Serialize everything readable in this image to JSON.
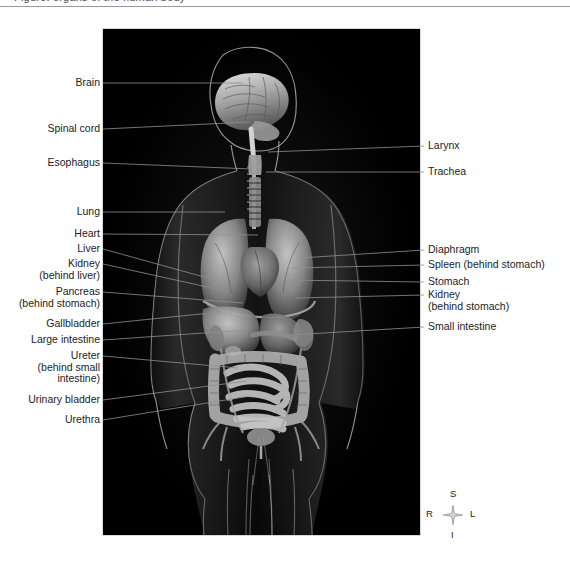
{
  "header": {
    "cropped_text": "Figure: organs of the human body"
  },
  "figure": {
    "caption_alt": "Frontal view of a human body with internal organs visible on a black background",
    "panel_bg": "#000000"
  },
  "labels_left": [
    {
      "id": "brain",
      "text": "Brain",
      "x": 68,
      "y": 77,
      "w": 32,
      "tip_x": 242,
      "tip_y": 83
    },
    {
      "id": "spinal-cord",
      "text": "Spinal cord",
      "x": 44,
      "y": 123,
      "w": 56,
      "tip_x": 250,
      "tip_y": 122
    },
    {
      "id": "esophagus",
      "text": "Esophagus",
      "x": 46,
      "y": 157,
      "w": 54,
      "tip_x": 252,
      "tip_y": 169
    },
    {
      "id": "lung",
      "text": "Lung",
      "x": 72,
      "y": 206,
      "w": 28,
      "tip_x": 225,
      "tip_y": 212
    },
    {
      "id": "heart",
      "text": "Heart",
      "x": 70,
      "y": 228,
      "w": 30,
      "tip_x": 258,
      "tip_y": 235
    },
    {
      "id": "liver",
      "text": "Liver",
      "x": 73,
      "y": 243,
      "w": 27,
      "tip_x": 215,
      "tip_y": 280
    },
    {
      "id": "kidney-left",
      "text": "Kidney\n(behind liver)",
      "x": 28,
      "y": 258,
      "w": 72,
      "tip_x": 230,
      "tip_y": 292
    },
    {
      "id": "pancreas",
      "text": "Pancreas\n(behind stomach)",
      "x": 8,
      "y": 286,
      "w": 92,
      "tip_x": 243,
      "tip_y": 303
    },
    {
      "id": "gallbladder",
      "text": "Gallbladder",
      "x": 45,
      "y": 318,
      "w": 55,
      "tip_x": 220,
      "tip_y": 312
    },
    {
      "id": "large-intestine",
      "text": "Large intestine",
      "x": 29,
      "y": 334,
      "w": 71,
      "tip_x": 247,
      "tip_y": 330
    },
    {
      "id": "ureter",
      "text": "Ureter\n(behind small\nintestine)",
      "x": 36,
      "y": 350,
      "w": 64,
      "tip_x": 238,
      "tip_y": 368
    },
    {
      "id": "urinary-bladder",
      "text": "Urinary bladder",
      "x": 27,
      "y": 394,
      "w": 73,
      "tip_x": 247,
      "tip_y": 381
    },
    {
      "id": "urethra",
      "text": "Urethra",
      "x": 59,
      "y": 414,
      "w": 41,
      "tip_x": 250,
      "tip_y": 396
    }
  ],
  "labels_right": [
    {
      "id": "larynx",
      "text": "Larynx",
      "x": 428,
      "y": 140,
      "tip_x": 268,
      "tip_y": 152
    },
    {
      "id": "trachea",
      "text": "Trachea",
      "x": 428,
      "y": 166,
      "tip_x": 266,
      "tip_y": 172
    },
    {
      "id": "diaphragm",
      "text": "Diaphragm",
      "x": 428,
      "y": 244,
      "tip_x": 300,
      "tip_y": 258
    },
    {
      "id": "spleen",
      "text": "Spleen (behind stomach)",
      "x": 428,
      "y": 259,
      "tip_x": 292,
      "tip_y": 268
    },
    {
      "id": "stomach",
      "text": "Stomach",
      "x": 428,
      "y": 276,
      "tip_x": 285,
      "tip_y": 280
    },
    {
      "id": "kidney-right",
      "text": "Kidney\n(behind stomach)",
      "x": 428,
      "y": 289,
      "tip_x": 296,
      "tip_y": 298
    },
    {
      "id": "small-intestine",
      "text": "Small intestine",
      "x": 428,
      "y": 321,
      "tip_x": 290,
      "tip_y": 335
    }
  ],
  "compass": {
    "superior": "S",
    "inferior": "I",
    "right": "R",
    "left": "L"
  }
}
